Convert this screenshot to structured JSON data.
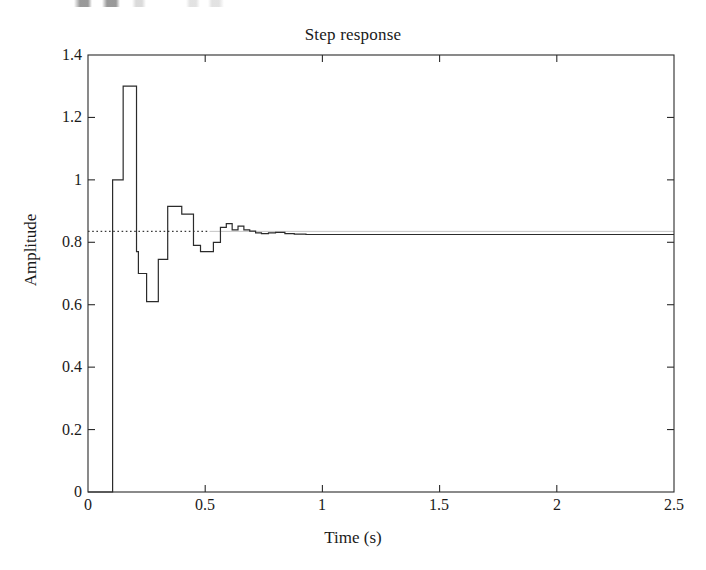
{
  "chart_data": {
    "type": "line",
    "title": "Step response",
    "xlabel": "Time (s)",
    "ylabel": "Amplitude",
    "xlim": [
      0,
      2.5
    ],
    "ylim": [
      0,
      1.4
    ],
    "xticks": [
      "0",
      "0.5",
      "1",
      "1.5",
      "2",
      "2.5"
    ],
    "xtick_values": [
      0,
      0.5,
      1,
      1.5,
      2,
      2.5
    ],
    "yticks": [
      "0",
      "0.2",
      "0.4",
      "0.6",
      "0.8",
      "1",
      "1.2",
      "1.4"
    ],
    "ytick_values": [
      0,
      0.2,
      0.4,
      0.6,
      0.8,
      1,
      1.2,
      1.4
    ],
    "grid": false,
    "legend": null,
    "style": "zero-order-hold staircase",
    "line_color": "#2b2b2b",
    "reference_line": {
      "name": "steady-state reference",
      "orientation": "horizontal",
      "value": 0.835,
      "style": "dotted",
      "color": "#3a3a3a",
      "x_start": 0.0,
      "x_end": 0.52
    },
    "annotations": {
      "dead_time_s": 0.105,
      "peak_value": 1.3,
      "peak_time_s": 0.162,
      "min_value": 0.61,
      "min_time_s": 0.272,
      "settling_value": 0.825,
      "sample_period_s": 0.045
    },
    "series": [
      {
        "name": "Step response",
        "x": [
          0.0,
          0.105,
          0.105,
          0.15,
          0.15,
          0.162,
          0.162,
          0.207,
          0.207,
          0.215,
          0.215,
          0.25,
          0.25,
          0.272,
          0.272,
          0.3,
          0.3,
          0.318,
          0.318,
          0.34,
          0.34,
          0.365,
          0.365,
          0.4,
          0.4,
          0.42,
          0.42,
          0.45,
          0.45,
          0.48,
          0.48,
          0.51,
          0.51,
          0.535,
          0.535,
          0.565,
          0.565,
          0.59,
          0.59,
          0.615,
          0.615,
          0.64,
          0.64,
          0.665,
          0.665,
          0.69,
          0.69,
          0.715,
          0.715,
          0.74,
          0.74,
          0.77,
          0.77,
          0.8,
          0.8,
          0.84,
          0.84,
          0.88,
          0.88,
          0.93,
          0.93,
          1.0,
          1.0,
          2.5
        ],
        "y": [
          0.0,
          0.0,
          1.0,
          1.0,
          1.3,
          1.3,
          1.3,
          1.3,
          0.77,
          0.77,
          0.7,
          0.7,
          0.61,
          0.61,
          0.61,
          0.61,
          0.745,
          0.745,
          0.745,
          0.745,
          0.915,
          0.915,
          0.915,
          0.915,
          0.89,
          0.89,
          0.89,
          0.89,
          0.79,
          0.79,
          0.77,
          0.77,
          0.77,
          0.77,
          0.8,
          0.8,
          0.848,
          0.848,
          0.86,
          0.86,
          0.84,
          0.84,
          0.852,
          0.852,
          0.84,
          0.84,
          0.836,
          0.836,
          0.83,
          0.83,
          0.828,
          0.828,
          0.83,
          0.83,
          0.832,
          0.832,
          0.828,
          0.828,
          0.826,
          0.826,
          0.825,
          0.825,
          0.825,
          0.825
        ]
      }
    ]
  },
  "figure": {
    "title": "Step response",
    "xlabel": "Time (s)",
    "ylabel": "Amplitude"
  }
}
